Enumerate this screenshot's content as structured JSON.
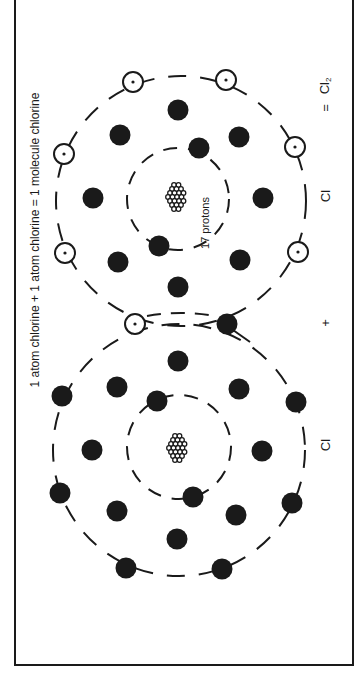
{
  "title": "1 atom chlorine + 1 atom chlorine = 1 molecule chlorine",
  "equation": {
    "atom1_symbol": "Cl",
    "plus": "+",
    "atom2_symbol": "Cl",
    "equals": "=",
    "product_symbol": "Cl",
    "product_subscript": "2"
  },
  "nucleus_label": "17 protons",
  "colors": {
    "ink": "#1a1a1a",
    "background": "#ffffff"
  },
  "atoms": [
    {
      "name": "chlorine-atom-top",
      "nucleus": {
        "cx": 176,
        "cy": 197
      },
      "inner_shell": {
        "cx": 178,
        "cy": 199,
        "r": 51
      },
      "outer_shell": {
        "cx": 181,
        "cy": 201,
        "r": 125
      },
      "filled_electrons": [
        [
          178,
          110
        ],
        [
          120,
          135
        ],
        [
          239,
          137
        ],
        [
          199,
          148
        ],
        [
          93,
          198
        ],
        [
          263,
          198
        ],
        [
          159,
          246
        ],
        [
          118,
          262
        ],
        [
          240,
          260
        ],
        [
          178,
          287
        ]
      ],
      "open_electrons": [
        [
          133,
          82
        ],
        [
          226,
          80
        ],
        [
          64,
          154
        ],
        [
          295,
          147
        ],
        [
          65,
          253
        ],
        [
          298,
          252
        ]
      ]
    },
    {
      "name": "chlorine-atom-bottom",
      "nucleus": {
        "cx": 177,
        "cy": 448
      },
      "inner_shell": {
        "cx": 179,
        "cy": 447,
        "r": 52
      },
      "outer_shell": {
        "cx": 179,
        "cy": 450,
        "r": 126
      },
      "filled_electrons": [
        [
          178,
          361
        ],
        [
          117,
          387
        ],
        [
          239,
          389
        ],
        [
          157,
          401
        ],
        [
          62,
          396
        ],
        [
          296,
          402
        ],
        [
          92,
          450
        ],
        [
          262,
          451
        ],
        [
          60,
          493
        ],
        [
          292,
          503
        ],
        [
          193,
          497
        ],
        [
          117,
          511
        ],
        [
          236,
          515
        ],
        [
          177,
          539
        ],
        [
          126,
          568
        ],
        [
          222,
          569
        ]
      ],
      "open_electrons": []
    }
  ],
  "shared_electrons": {
    "open": [
      135,
      324
    ],
    "filled": [
      227,
      324
    ]
  }
}
